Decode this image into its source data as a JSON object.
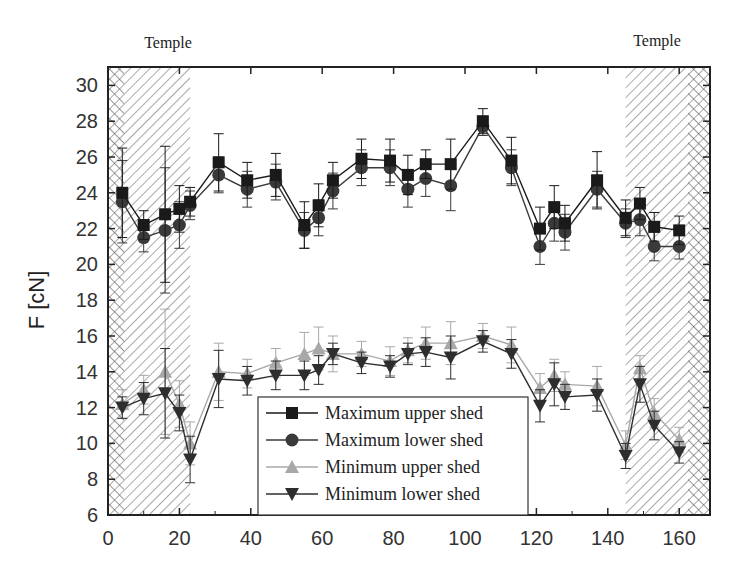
{
  "chart_data": {
    "type": "line",
    "title": "",
    "xlabel": "",
    "ylabel": "F [cN]",
    "xlim": [
      0,
      168
    ],
    "ylim": [
      6,
      31
    ],
    "xticks": [
      0,
      20,
      40,
      60,
      80,
      100,
      120,
      140,
      160
    ],
    "yticks": [
      6,
      8,
      10,
      12,
      14,
      16,
      18,
      20,
      22,
      24,
      26,
      28,
      30
    ],
    "grid": false,
    "legend_position": "lower center (inside plot)",
    "annotations": [
      {
        "text": "Temple",
        "position": "top-left",
        "shaded_region": [
          0,
          23
        ]
      },
      {
        "text": "Temple",
        "position": "top-right",
        "shaded_region": [
          145,
          168
        ]
      }
    ],
    "x": [
      4,
      10,
      16,
      20,
      23,
      31,
      39,
      47,
      55,
      59,
      63,
      71,
      79,
      84,
      89,
      96,
      105,
      113,
      121,
      125,
      128,
      137,
      145,
      149,
      153,
      160
    ],
    "series": [
      {
        "name": "Maximum upper shed",
        "marker": "square",
        "color": "#1a1a1a",
        "values": [
          24.0,
          22.2,
          22.8,
          23.1,
          23.5,
          25.7,
          24.7,
          25.0,
          22.2,
          23.3,
          24.7,
          25.9,
          25.8,
          25.0,
          25.6,
          25.6,
          28.0,
          25.8,
          22.0,
          23.2,
          22.3,
          24.7,
          22.6,
          23.4,
          22.1,
          21.9
        ],
        "errors": [
          2.5,
          0.8,
          3.8,
          1.3,
          0.8,
          1.6,
          1.0,
          1.2,
          1.3,
          1.2,
          1.0,
          1.1,
          1.2,
          1.1,
          0.8,
          1.4,
          0.7,
          1.3,
          1.2,
          1.2,
          1.0,
          1.6,
          1.0,
          0.9,
          0.8,
          0.8
        ]
      },
      {
        "name": "Maximum lower shed",
        "marker": "circle",
        "color": "#3a3a3a",
        "values": [
          23.5,
          21.5,
          21.9,
          22.2,
          23.3,
          25.0,
          24.2,
          24.6,
          21.9,
          22.6,
          24.1,
          25.4,
          25.4,
          24.2,
          24.8,
          24.4,
          27.7,
          25.4,
          21.0,
          22.3,
          21.8,
          24.2,
          22.3,
          22.5,
          21.0,
          21.0
        ],
        "errors": [
          2.3,
          0.8,
          3.5,
          1.3,
          0.8,
          1.0,
          1.0,
          1.0,
          1.0,
          1.0,
          1.0,
          1.0,
          1.0,
          1.0,
          1.0,
          1.4,
          0.5,
          1.0,
          1.0,
          1.0,
          1.0,
          1.0,
          0.8,
          0.9,
          0.8,
          0.7
        ]
      },
      {
        "name": "Minimum upper shed",
        "marker": "triangle-up",
        "color": "#a8a8a8",
        "values": [
          12.2,
          13.0,
          14.0,
          12.2,
          10.0,
          14.0,
          13.9,
          14.5,
          15.0,
          15.3,
          15.0,
          15.0,
          14.6,
          15.2,
          15.6,
          15.6,
          16.0,
          15.5,
          13.1,
          13.8,
          13.3,
          13.2,
          9.9,
          14.2,
          11.7,
          10.2
        ],
        "errors": [
          0.8,
          0.8,
          3.5,
          1.3,
          1.2,
          1.6,
          0.8,
          0.8,
          1.2,
          1.2,
          1.0,
          0.7,
          0.8,
          0.7,
          0.9,
          1.2,
          0.7,
          1.0,
          0.8,
          0.9,
          0.7,
          1.1,
          0.8,
          0.7,
          0.8,
          0.7
        ]
      },
      {
        "name": "Minimum lower shed",
        "marker": "triangle-down",
        "color": "#2e2e2e",
        "values": [
          12.0,
          12.5,
          12.8,
          11.7,
          9.1,
          13.6,
          13.5,
          13.8,
          13.8,
          14.1,
          15.0,
          14.5,
          14.3,
          15.0,
          15.1,
          14.8,
          15.7,
          15.0,
          12.1,
          13.3,
          12.6,
          12.7,
          9.3,
          13.3,
          11.0,
          9.5
        ],
        "errors": [
          0.6,
          0.9,
          2.5,
          1.0,
          1.3,
          1.6,
          0.8,
          0.8,
          0.8,
          0.8,
          0.6,
          0.6,
          0.6,
          0.6,
          0.8,
          1.2,
          0.6,
          0.8,
          0.9,
          1.2,
          0.7,
          0.9,
          0.7,
          1.0,
          0.8,
          0.6
        ]
      }
    ]
  },
  "labels": {
    "temple_left": "Temple",
    "temple_right": "Temple",
    "ylabel": "F [cN]",
    "legend": [
      "Maximum upper shed",
      "Maximum lower shed",
      "Minimum upper shed",
      "Minimum lower shed"
    ]
  }
}
